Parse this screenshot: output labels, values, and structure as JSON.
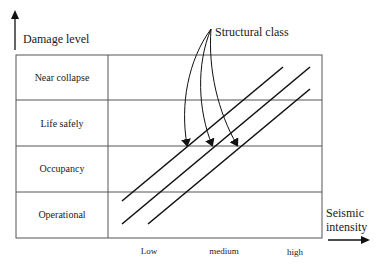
{
  "y_axis": {
    "label": "Damage level"
  },
  "x_axis": {
    "label_line1": "Seismic",
    "label_line2": "intensity",
    "ticks": [
      "Low",
      "medium",
      "high"
    ]
  },
  "annotation": {
    "label": "Structural class"
  },
  "rows": [
    {
      "label": "Near collapse"
    },
    {
      "label": "Life safely"
    },
    {
      "label": "Occupancy"
    },
    {
      "label": "Operational"
    }
  ],
  "colors": {
    "line": "#111111",
    "grid": "#555555",
    "background": "#ffffff"
  }
}
